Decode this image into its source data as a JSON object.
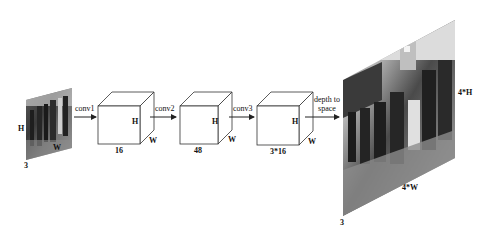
{
  "diagram": {
    "title": "",
    "input_image": {
      "label_height": "H",
      "label_width": "W",
      "label_channels": "3"
    },
    "steps": [
      {
        "arrow_label": "conv1",
        "block": {
          "channels": "16",
          "label_height": "H",
          "label_width": "W"
        }
      },
      {
        "arrow_label": "conv2",
        "block": {
          "channels": "48",
          "label_height": "H",
          "label_width": "W"
        }
      },
      {
        "arrow_label": "conv3",
        "block": {
          "channels": "3*16",
          "label_height": "H",
          "label_width": "W"
        }
      }
    ],
    "final_arrow": {
      "label_line1": "depth to",
      "label_line2": "space"
    },
    "output_image": {
      "label_height": "4*H",
      "label_width": "4*W",
      "label_channels": "3"
    },
    "colors": {
      "background": "#ffffff",
      "line": "#222222",
      "photo_dark": "#2a2a2a",
      "photo_mid": "#7a7a7a",
      "photo_light": "#d8d8d8"
    }
  }
}
